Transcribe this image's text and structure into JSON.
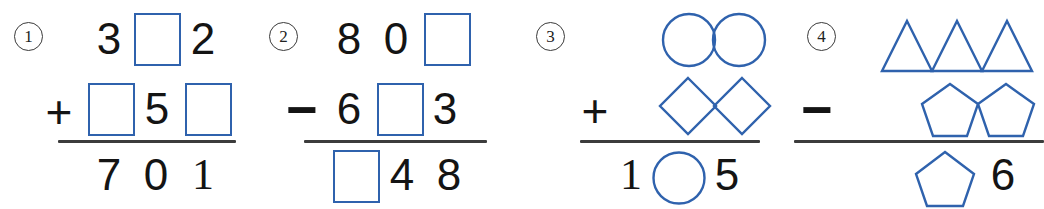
{
  "page": {
    "background": "#ffffff",
    "ink_color": "#141414",
    "shape_color": "#2f62ad",
    "rule_color": "#3c3c3c"
  },
  "problems": [
    {
      "index": "1",
      "operator": "+",
      "operator_name": "plus",
      "rows": [
        {
          "cells": [
            {
              "kind": "digit",
              "value": "3"
            },
            {
              "kind": "blank_box"
            },
            {
              "kind": "digit",
              "value": "2"
            }
          ]
        },
        {
          "cells": [
            {
              "kind": "blank_box"
            },
            {
              "kind": "digit",
              "value": "5"
            },
            {
              "kind": "blank_box"
            }
          ]
        },
        {
          "cells": [
            {
              "kind": "digit",
              "value": "7"
            },
            {
              "kind": "digit",
              "value": "0"
            },
            {
              "kind": "digit",
              "value": "1"
            }
          ]
        }
      ]
    },
    {
      "index": "2",
      "operator": "−",
      "operator_name": "minus",
      "rows": [
        {
          "cells": [
            {
              "kind": "digit",
              "value": "8"
            },
            {
              "kind": "digit",
              "value": "0"
            },
            {
              "kind": "blank_box"
            }
          ]
        },
        {
          "cells": [
            {
              "kind": "digit",
              "value": "6"
            },
            {
              "kind": "blank_box"
            },
            {
              "kind": "digit",
              "value": "3"
            }
          ]
        },
        {
          "cells": [
            {
              "kind": "blank_box"
            },
            {
              "kind": "digit",
              "value": "4"
            },
            {
              "kind": "digit",
              "value": "8"
            }
          ]
        }
      ]
    },
    {
      "index": "3",
      "operator": "+",
      "operator_name": "plus",
      "rows": [
        {
          "cells": [
            {
              "kind": "shape",
              "shape": "circle",
              "count": 2
            }
          ]
        },
        {
          "cells": [
            {
              "kind": "shape",
              "shape": "diamond",
              "count": 2
            }
          ]
        },
        {
          "cells": [
            {
              "kind": "digit",
              "value": "1"
            },
            {
              "kind": "shape",
              "shape": "circle",
              "count": 1
            },
            {
              "kind": "digit",
              "value": "5"
            }
          ]
        }
      ]
    },
    {
      "index": "4",
      "operator": "−",
      "operator_name": "minus",
      "rows": [
        {
          "cells": [
            {
              "kind": "shape",
              "shape": "triangle",
              "count": 3
            }
          ]
        },
        {
          "cells": [
            {
              "kind": "shape",
              "shape": "pentagon",
              "count": 2
            }
          ]
        },
        {
          "cells": [
            {
              "kind": "shape",
              "shape": "pentagon",
              "count": 1
            },
            {
              "kind": "digit",
              "value": "6"
            }
          ]
        }
      ]
    }
  ]
}
